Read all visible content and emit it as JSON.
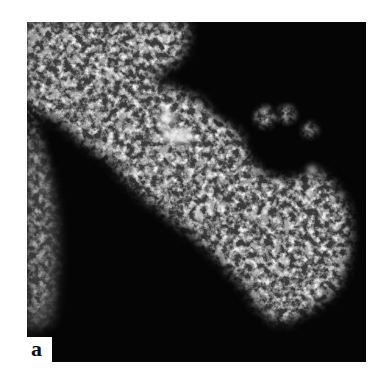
{
  "figure": {
    "panel_label": "a",
    "colors": {
      "background": "#050505",
      "signal": "#e8e8e8",
      "page": "#ffffff",
      "label": "#111111"
    }
  }
}
